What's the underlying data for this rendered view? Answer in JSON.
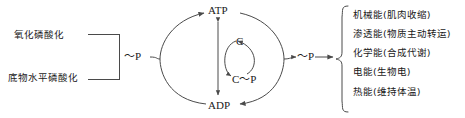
{
  "diagram": {
    "inputs": [
      {
        "label": "氧化磷酸化"
      },
      {
        "label": "底物水平磷酸化"
      }
    ],
    "energy_carrier_left": "～P",
    "energy_carrier_right": "～P",
    "cycle": {
      "top": "ATP",
      "bottom": "ADP",
      "inner_top": "C",
      "inner_bottom": "C～P"
    },
    "outputs": [
      {
        "label": "机械能(肌肉收缩)"
      },
      {
        "label": "渗透能(物质主动转运)"
      },
      {
        "label": "化学能(合成代谢)"
      },
      {
        "label": "电能(生物电)"
      },
      {
        "label": "热能(维持体温)"
      }
    ],
    "colors": {
      "stroke": "#4a4a4a",
      "text": "#1a1a1a",
      "background": "#ffffff"
    }
  }
}
